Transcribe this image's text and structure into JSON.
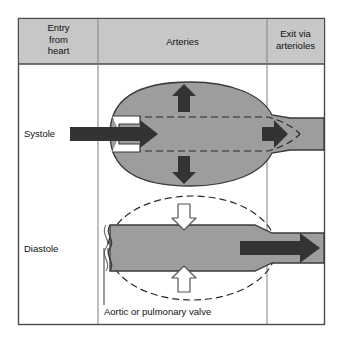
{
  "figure": {
    "frame_border_color": "#4a4a4a",
    "background_color": "#ffffff"
  },
  "table": {
    "header": {
      "fill_color": "#c7c7c7",
      "columns": [
        {
          "id": "entry",
          "lines": [
            "Entry",
            "from",
            "heart"
          ]
        },
        {
          "id": "arteries",
          "lines": [
            "Arteries"
          ]
        },
        {
          "id": "exit",
          "lines": [
            "Exit via",
            "arterioles"
          ]
        }
      ]
    },
    "rows": [
      {
        "id": "systole",
        "label": "Systole"
      },
      {
        "id": "diastole",
        "label": "Diastole"
      }
    ]
  },
  "annotations": {
    "valve_callout": "Aortic or pulmonary valve"
  },
  "legend_semantics": {
    "vessel_fill": "#9d9d9d",
    "vessel_outline": "#3a3a3a",
    "solid_arrow_color": "#333333",
    "hollow_arrow_fill": "#ffffff",
    "hollow_arrow_outline": "#555555",
    "dashed_outline_color": "#2b2b2b",
    "valve_cusp_fill": "#ffffff"
  },
  "diagram_data": {
    "type": "diagram",
    "systole": {
      "vessel_state": "distended",
      "inflow_arrow": "large solid arrow entering through open valve",
      "wall_arrows": "two solid arrows pointing outward (up and down), artery expands",
      "outflow_arrow": "short solid arrow, limited flow to arterioles",
      "valve_state": "open",
      "dashed_outline_meaning": "resting (undistended) artery diameter"
    },
    "diastole": {
      "vessel_state": "recoiled",
      "inflow_arrow": "none, no flow from heart",
      "wall_arrows": "two hollow arrows pointing inward (down and up), elastic recoil",
      "outflow_arrow": "long solid arrow, continued flow to arterioles",
      "valve_state": "closed",
      "dashed_outline_meaning": "previous distended artery outline"
    }
  }
}
